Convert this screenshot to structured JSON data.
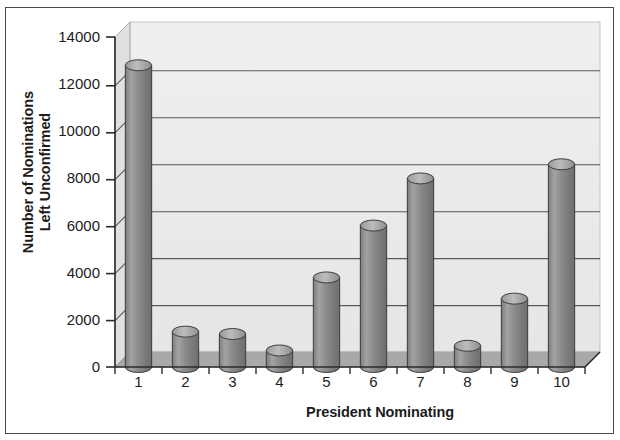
{
  "chart_data": {
    "type": "bar",
    "title": "",
    "subtitle": "",
    "xlabel": "President Nominating",
    "ylabel": "Number of Nominations Left Unconfirmed",
    "categories": [
      "1",
      "2",
      "3",
      "4",
      "5",
      "6",
      "7",
      "8",
      "9",
      "10"
    ],
    "values": [
      12800,
      1500,
      1400,
      700,
      3800,
      6000,
      8000,
      900,
      2900,
      8600
    ],
    "ylim": [
      0,
      14000
    ],
    "ytick_labels": [
      "0",
      "2000",
      "4000",
      "6000",
      "8000",
      "10000",
      "12000",
      "14000"
    ],
    "ytick_values": [
      0,
      2000,
      4000,
      6000,
      8000,
      10000,
      12000,
      14000
    ],
    "grid": true,
    "grid_axis": "y",
    "legend": false,
    "legend_position": "none",
    "style": "3d-cylinder",
    "colors": {
      "bar_fill": "#8f8f8f",
      "bar_fill_light": "#b4b4b4",
      "bar_fill_dark": "#6f6f6f",
      "bar_edge": "#3c3c3c",
      "plot_background": "#f0f0f0",
      "wall_background": "#eaeaea",
      "floor": "#a8a8a8",
      "gridline": "#555555",
      "axis": "#2b2b2b",
      "text": "#1c1c1c",
      "frame": "#4a4a4a"
    }
  }
}
